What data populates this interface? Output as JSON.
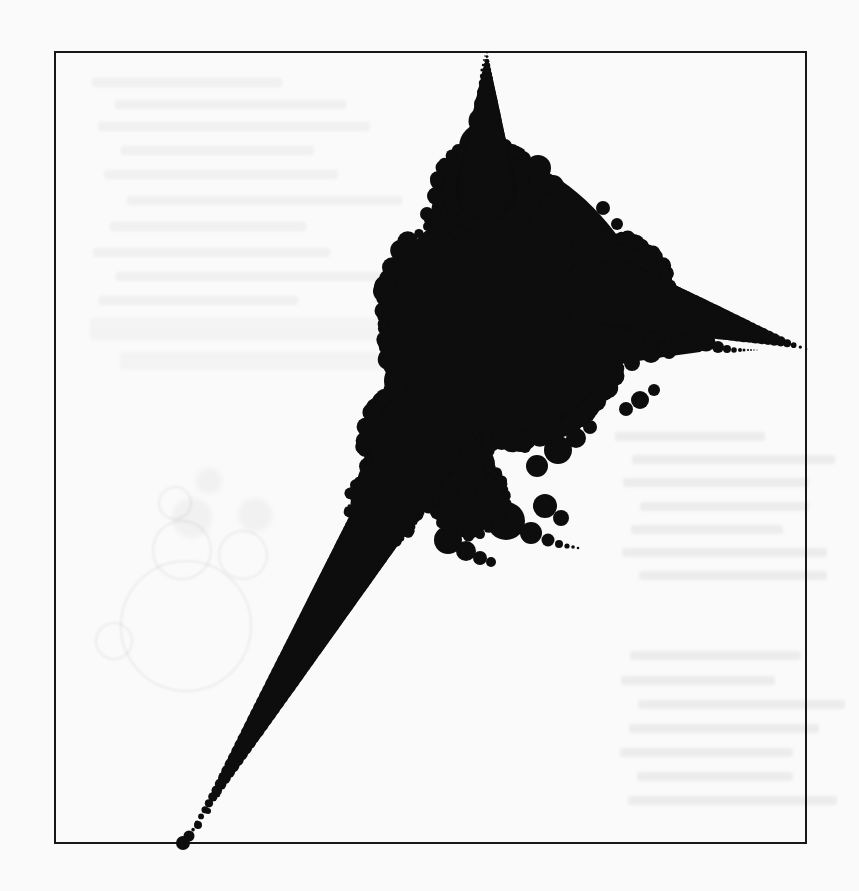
{
  "figure": {
    "caption": "",
    "kind": "limit-set-fractal",
    "ink_color": "#0d0d0d",
    "paper_color": "#fafafa",
    "frame_color": "#171717"
  },
  "frame": {
    "left": 54,
    "top": 51,
    "width": 753,
    "height": 793,
    "border_px": 2.5
  },
  "chart_data": {
    "type": "scatter",
    "title": "",
    "subtitle": "",
    "xlabel": "",
    "ylabel": "",
    "grid": false,
    "legend": null,
    "xlim": [
      54,
      807
    ],
    "ylim": [
      51,
      844
    ],
    "columns": [
      "cx",
      "cy",
      "r"
    ],
    "main_disk": [
      505,
      318,
      118
    ],
    "cusp_points": [
      {
        "name": "top-cusp",
        "x": 487,
        "y": 51
      },
      {
        "name": "right-cusp",
        "x": 807,
        "y": 349
      },
      {
        "name": "bottom-left-cusp",
        "x": 185,
        "y": 843
      }
    ],
    "circles": [
      [
        505,
        318,
        118
      ],
      [
        486,
        191,
        46
      ],
      [
        483,
        147,
        24
      ],
      [
        482,
        121,
        13.5
      ],
      [
        482,
        104,
        8
      ],
      [
        482,
        92,
        5
      ],
      [
        482,
        83,
        3.2
      ],
      [
        482,
        76,
        2.2
      ],
      [
        482,
        70,
        1.6
      ],
      [
        483,
        65,
        1.2
      ],
      [
        484,
        60,
        1.0
      ],
      [
        485,
        56,
        0.8
      ],
      [
        487,
        53,
        0.6
      ],
      [
        538,
        168,
        13
      ],
      [
        553,
        186,
        11
      ],
      [
        447,
        176,
        10
      ],
      [
        436,
        196,
        9
      ],
      [
        512,
        152,
        8
      ],
      [
        460,
        161,
        7
      ],
      [
        563,
        206,
        8
      ],
      [
        427,
        214,
        7
      ],
      [
        614,
        293,
        52
      ],
      [
        658,
        317,
        28
      ],
      [
        687,
        333,
        16
      ],
      [
        706,
        342,
        9.5
      ],
      [
        718,
        347,
        6
      ],
      [
        727,
        349,
        4
      ],
      [
        734,
        350,
        2.8
      ],
      [
        740,
        350,
        2.0
      ],
      [
        744,
        350,
        1.5
      ],
      [
        748,
        350,
        1.1
      ],
      [
        751,
        350,
        0.9
      ],
      [
        754,
        350,
        0.7
      ],
      [
        757,
        350,
        0.55
      ],
      [
        588,
        240,
        16
      ],
      [
        603,
        256,
        12
      ],
      [
        640,
        285,
        11
      ],
      [
        598,
        345,
        15
      ],
      [
        617,
        352,
        11
      ],
      [
        651,
        353,
        10
      ],
      [
        669,
        352,
        7
      ],
      [
        578,
        227,
        11
      ],
      [
        632,
        363,
        8
      ],
      [
        681,
        348,
        5
      ],
      [
        426,
        444,
        58
      ],
      [
        383,
        508,
        33
      ],
      [
        355,
        552,
        19
      ],
      [
        338,
        582,
        11.5
      ],
      [
        327,
        602,
        7
      ],
      [
        320,
        615,
        4.5
      ],
      [
        315,
        624,
        3.0
      ],
      [
        311,
        631,
        2.2
      ],
      [
        308,
        636,
        1.7
      ],
      [
        305,
        641,
        1.4
      ],
      [
        302,
        646,
        1.2
      ],
      [
        299,
        652,
        1.1
      ],
      [
        296,
        658,
        1.0
      ],
      [
        292,
        665,
        1.0
      ],
      [
        288,
        673,
        1.0
      ],
      [
        283,
        682,
        1.0
      ],
      [
        277,
        692,
        1.0
      ],
      [
        271,
        703,
        1.0
      ],
      [
        264,
        716,
        1.1
      ],
      [
        256,
        730,
        1.2
      ],
      [
        247,
        745,
        1.3
      ],
      [
        238,
        761,
        1.5
      ],
      [
        228,
        778,
        1.8
      ],
      [
        218,
        795,
        2.2
      ],
      [
        208,
        811,
        3.0
      ],
      [
        198,
        825,
        4.0
      ],
      [
        189,
        836,
        5.5
      ],
      [
        183,
        843,
        7.0
      ],
      [
        406,
        381,
        22
      ],
      [
        390,
        404,
        15
      ],
      [
        378,
        423,
        10
      ],
      [
        369,
        437,
        7
      ],
      [
        412,
        491,
        16
      ],
      [
        402,
        513,
        11
      ],
      [
        394,
        530,
        7
      ],
      [
        370,
        478,
        12
      ],
      [
        358,
        497,
        8
      ],
      [
        350,
        512,
        5.5
      ],
      [
        470,
        499,
        34
      ],
      [
        506,
        521,
        19
      ],
      [
        531,
        533,
        11
      ],
      [
        548,
        540,
        6.5
      ],
      [
        559,
        544,
        4
      ],
      [
        567,
        546,
        2.6
      ],
      [
        573,
        547,
        1.8
      ],
      [
        578,
        548,
        1.3
      ],
      [
        448,
        540,
        14
      ],
      [
        466,
        551,
        10
      ],
      [
        480,
        558,
        7
      ],
      [
        491,
        562,
        5
      ],
      [
        558,
        450,
        14
      ],
      [
        576,
        438,
        10
      ],
      [
        590,
        427,
        7
      ],
      [
        537,
        466,
        11
      ],
      [
        545,
        506,
        12
      ],
      [
        561,
        518,
        8
      ],
      [
        640,
        400,
        9
      ],
      [
        654,
        390,
        6
      ],
      [
        626,
        409,
        7
      ],
      [
        420,
        290,
        9
      ],
      [
        412,
        312,
        8
      ],
      [
        406,
        332,
        7
      ],
      [
        400,
        350,
        6
      ],
      [
        434,
        268,
        8
      ],
      [
        452,
        250,
        6
      ],
      [
        603,
        208,
        7
      ],
      [
        617,
        224,
        6
      ],
      [
        629,
        240,
        5
      ],
      [
        500,
        438,
        7
      ],
      [
        525,
        447,
        6
      ],
      [
        475,
        430,
        6
      ],
      [
        692,
        320,
        6
      ],
      [
        700,
        330,
        4
      ]
    ]
  },
  "bleed_through": {
    "visible": true,
    "description": "Faint ghost of text lines and circle outlines printed on the reverse of the page.",
    "text_block_right": {
      "lines": 11
    },
    "text_block_top_left": {
      "lines": 9
    },
    "circle_ghosts": 6
  }
}
